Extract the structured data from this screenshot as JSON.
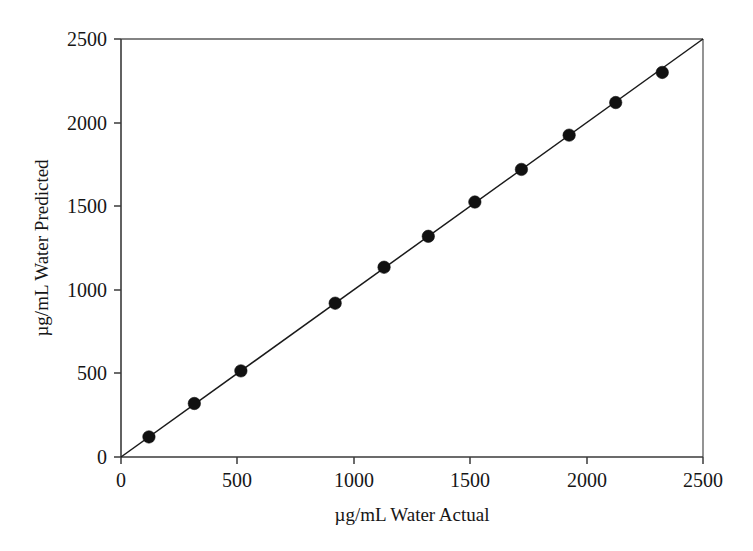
{
  "chart_data": {
    "type": "scatter",
    "title": "",
    "subtitle": "",
    "xlabel": "µg/mL Water Actual",
    "ylabel": "µg/mL Water Predicted",
    "xlim": [
      0,
      2500
    ],
    "ylim": [
      0,
      2500
    ],
    "xticks": [
      0,
      500,
      1000,
      1500,
      2000,
      2500
    ],
    "yticks": [
      0,
      500,
      1000,
      1500,
      2000,
      2500
    ],
    "xtick_labels": [
      "0",
      "500",
      "1000",
      "1500",
      "2000",
      "2500"
    ],
    "ytick_labels": [
      "0",
      "500",
      "1000",
      "1500",
      "2000",
      "2500"
    ],
    "grid": false,
    "legend": null,
    "legend_position": "none",
    "marker": "filled-circle",
    "marker_color": "#111111",
    "line_color": "#1a1a1a",
    "axis_color": "#3a3a3a",
    "background_color": "#ffffff",
    "series": [
      {
        "name": "Water calibration",
        "x": [
          120,
          315,
          515,
          920,
          1130,
          1320,
          1520,
          1720,
          1925,
          2125,
          2325
        ],
        "y": [
          120,
          320,
          515,
          920,
          1135,
          1320,
          1525,
          1720,
          1925,
          2120,
          2300
        ]
      }
    ],
    "reference_line": {
      "name": "1:1 identity line",
      "x": [
        0,
        2500
      ],
      "y": [
        0,
        2500
      ]
    },
    "annotations": []
  },
  "axes": {
    "x_title": "µg/mL Water Actual",
    "y_title": "µg/mL Water Predicted",
    "x_tick_labels": [
      "0",
      "500",
      "1000",
      "1500",
      "2000",
      "2500"
    ],
    "y_tick_labels": [
      "0",
      "500",
      "1000",
      "1500",
      "2000",
      "2500"
    ]
  }
}
